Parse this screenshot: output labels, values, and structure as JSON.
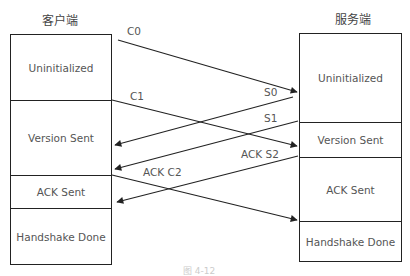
{
  "client": {
    "title": "客户端",
    "states": [
      {
        "label": "Uninitialized",
        "top": 0,
        "height": 65
      },
      {
        "label": "Version Sent",
        "top": 65,
        "height": 75
      },
      {
        "label": "ACK Sent",
        "top": 140,
        "height": 33
      },
      {
        "label": "Handshake Done",
        "top": 173,
        "height": 57
      }
    ]
  },
  "server": {
    "title": "服务端",
    "states": [
      {
        "label": "Uninitialized",
        "top": 0,
        "height": 88
      },
      {
        "label": "Version Sent",
        "top": 88,
        "height": 35
      },
      {
        "label": "ACK Sent",
        "top": 123,
        "height": 64
      },
      {
        "label": "Handshake Done",
        "top": 187,
        "height": 41
      }
    ]
  },
  "messages": [
    {
      "label": "C0",
      "from": "client",
      "to": "server"
    },
    {
      "label": "C1",
      "from": "client",
      "to": "server"
    },
    {
      "label": "S0",
      "from": "server",
      "to": "client"
    },
    {
      "label": "S1",
      "from": "server",
      "to": "client"
    },
    {
      "label": "ACK S2",
      "from": "server",
      "to": "client"
    },
    {
      "label": "ACK C2",
      "from": "client",
      "to": "server"
    }
  ],
  "caption": "图 4-12"
}
